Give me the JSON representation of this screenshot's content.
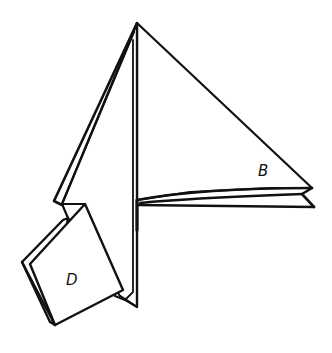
{
  "diagram": {
    "type": "origami-fold-step",
    "stroke_color": "#111111",
    "background": "#ffffff",
    "labels": [
      {
        "id": "B",
        "text": "B",
        "x": 258,
        "y": 176
      },
      {
        "id": "D",
        "text": "D",
        "x": 66,
        "y": 285
      }
    ]
  }
}
